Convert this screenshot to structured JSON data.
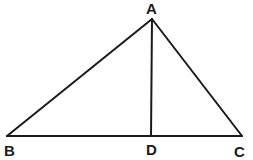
{
  "diagram": {
    "type": "triangle-with-altitude",
    "stroke_color": "#1a1a1a",
    "background": "#ffffff",
    "vertices": {
      "A": {
        "label": "A",
        "x": 152,
        "y": 19
      },
      "B": {
        "label": "B",
        "x": 7,
        "y": 136
      },
      "C": {
        "label": "C",
        "x": 242,
        "y": 136
      },
      "D": {
        "label": "D",
        "x": 151,
        "y": 136
      }
    },
    "segments": [
      "AB",
      "AC",
      "BC",
      "AD"
    ],
    "labels": {
      "A": "A",
      "B": "B",
      "C": "C",
      "D": "D"
    }
  }
}
